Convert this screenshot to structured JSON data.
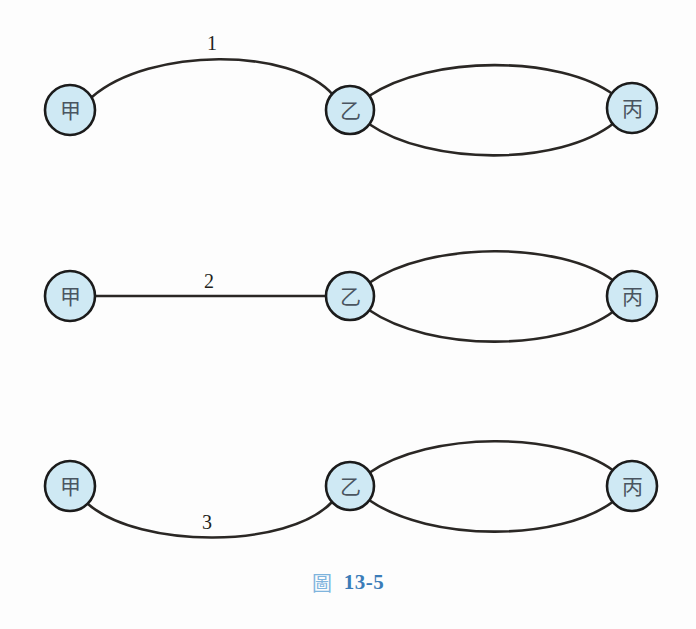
{
  "figure": {
    "caption_glyph": "圖",
    "caption_number": "13-5",
    "background_color": "#fdfdfd",
    "node_fill_color": "#cfe9f4",
    "node_stroke_color": "#1b1b1b",
    "edge_color": "#2a2724",
    "caption_glyph_color": "#7fb4dd",
    "caption_number_color": "#3a7cb8"
  },
  "rows": [
    {
      "id": "row-1",
      "nodes": [
        {
          "id": "row1-node-jia",
          "label": "甲",
          "cx": 70,
          "cy": 110,
          "r": 25
        },
        {
          "id": "row1-node-yi",
          "label": "乙",
          "cx": 350,
          "cy": 110,
          "r": 24
        },
        {
          "id": "row1-node-bing",
          "label": "丙",
          "cx": 632,
          "cy": 108,
          "r": 25
        }
      ],
      "edges": [
        {
          "id": "row1-edge-jia-yi",
          "from": "甲",
          "to": "乙",
          "label": "1",
          "shape": "arc-up"
        },
        {
          "id": "row1-edge-yi-bing-top",
          "from": "乙",
          "to": "丙",
          "label": "",
          "shape": "arc-up"
        },
        {
          "id": "row1-edge-yi-bing-bottom",
          "from": "乙",
          "to": "丙",
          "label": "",
          "shape": "arc-down"
        }
      ],
      "edge_label": {
        "text": "1",
        "x": 212,
        "y": 43
      }
    },
    {
      "id": "row-2",
      "nodes": [
        {
          "id": "row2-node-jia",
          "label": "甲",
          "cx": 70,
          "cy": 296,
          "r": 25
        },
        {
          "id": "row2-node-yi",
          "label": "乙",
          "cx": 350,
          "cy": 296,
          "r": 24
        },
        {
          "id": "row2-node-bing",
          "label": "丙",
          "cx": 632,
          "cy": 296,
          "r": 25
        }
      ],
      "edges": [
        {
          "id": "row2-edge-jia-yi",
          "from": "甲",
          "to": "乙",
          "label": "2",
          "shape": "straight"
        },
        {
          "id": "row2-edge-yi-bing-top",
          "from": "乙",
          "to": "丙",
          "label": "",
          "shape": "arc-up"
        },
        {
          "id": "row2-edge-yi-bing-bottom",
          "from": "乙",
          "to": "丙",
          "label": "",
          "shape": "arc-down"
        }
      ],
      "edge_label": {
        "text": "2",
        "x": 209,
        "y": 281
      }
    },
    {
      "id": "row-3",
      "nodes": [
        {
          "id": "row3-node-jia",
          "label": "甲",
          "cx": 70,
          "cy": 486,
          "r": 25
        },
        {
          "id": "row3-node-yi",
          "label": "乙",
          "cx": 350,
          "cy": 486,
          "r": 24
        },
        {
          "id": "row3-node-bing",
          "label": "丙",
          "cx": 632,
          "cy": 486,
          "r": 25
        }
      ],
      "edges": [
        {
          "id": "row3-edge-jia-yi",
          "from": "甲",
          "to": "乙",
          "label": "3",
          "shape": "arc-down"
        },
        {
          "id": "row3-edge-yi-bing-top",
          "from": "乙",
          "to": "丙",
          "label": "",
          "shape": "arc-up"
        },
        {
          "id": "row3-edge-yi-bing-bottom",
          "from": "乙",
          "to": "丙",
          "label": "",
          "shape": "arc-down"
        }
      ],
      "edge_label": {
        "text": "3",
        "x": 207,
        "y": 522
      }
    }
  ]
}
